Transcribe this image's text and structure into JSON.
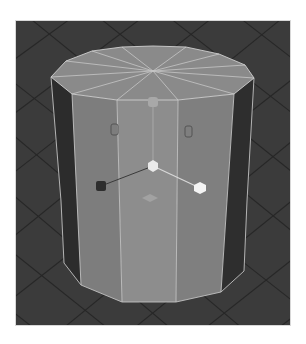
{
  "viewport": {
    "label": "3D viewport",
    "background_color": "#3a3a3a",
    "grid_line_color": "#262626"
  },
  "object": {
    "type": "polygon-cylinder",
    "sides": 12,
    "top_color": "#8a8a8a",
    "front_color": "#8c8c8c",
    "side_color_light": "#7c7c7c",
    "side_color_dark": "#2c2c2c",
    "wire_color": "#c8c8c8"
  },
  "manipulator": {
    "name": "transform-manipulator",
    "handles": [
      {
        "name": "center-handle",
        "color": "#e8e8e8"
      },
      {
        "name": "x-axis-handle",
        "color": "#f2f2f2"
      },
      {
        "name": "z-axis-handle",
        "color": "#2e2e2e"
      },
      {
        "name": "y-axis-handle",
        "color": "#a8a8a8"
      },
      {
        "name": "plane-handle",
        "color": "#a0a0a0"
      }
    ]
  }
}
